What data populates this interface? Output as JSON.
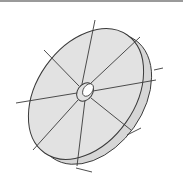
{
  "figure": {
    "segments": 8,
    "colors": {
      "face": "#e2e2e2",
      "rim": "#d6d6d6",
      "stroke": "#3a3a3a",
      "hole": "#ffffff",
      "top_rule": "#9a9a9a"
    }
  }
}
